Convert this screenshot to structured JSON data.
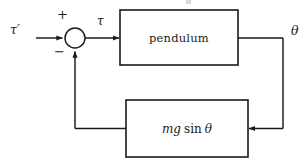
{
  "diagram": {
    "type": "control-block-diagram",
    "background_color": "#ffffff",
    "line_color": "#1a1a1a",
    "text_color": "#1a1a1a",
    "width": 308,
    "height": 168,
    "signals": {
      "input_label": "τ′",
      "summed_label": "τ",
      "output_label": "θ"
    },
    "summing_junction": {
      "name": "summing-junction",
      "cx": 75,
      "cy": 38,
      "r": 10,
      "plus_sign": "+",
      "minus_sign": "−",
      "plus_position": "upper-left",
      "minus_position": "lower-left"
    },
    "blocks": [
      {
        "id": "pendulum",
        "label": "pendulum",
        "x": 120,
        "y": 10,
        "width": 118,
        "height": 55
      },
      {
        "id": "feedback",
        "label": "mg sin θ",
        "label_parts": {
          "m": "m",
          "g": "g",
          "sin": "sin",
          "theta": "θ"
        },
        "x": 126,
        "y": 100,
        "width": 122,
        "height": 57
      }
    ],
    "connections": [
      {
        "id": "input-to-sum",
        "from": "tau-prime-input",
        "to": "summing-junction",
        "arrow": true
      },
      {
        "id": "sum-to-pendulum",
        "from": "summing-junction",
        "to": "pendulum",
        "label": "τ",
        "arrow": true
      },
      {
        "id": "pendulum-to-output",
        "from": "pendulum",
        "to": "theta-output",
        "label": "θ",
        "arrow": false
      },
      {
        "id": "output-to-feedback",
        "from": "theta-output",
        "to": "feedback",
        "arrow": true
      },
      {
        "id": "feedback-to-sum",
        "from": "feedback",
        "to": "summing-junction",
        "arrow": true,
        "sign": "−"
      }
    ]
  }
}
